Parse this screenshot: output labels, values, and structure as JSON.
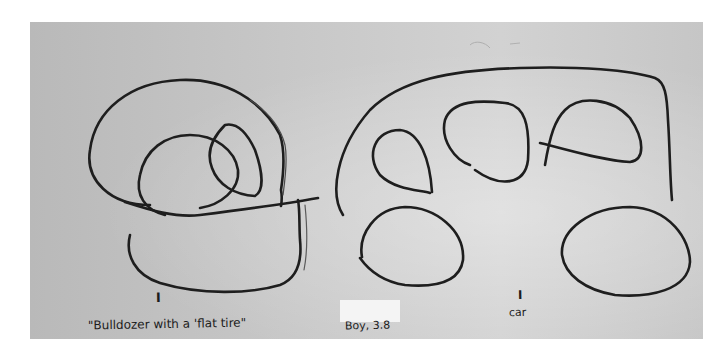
{
  "image": {
    "description": "Scanned child's crayon drawing on gray paper: a bulldozer (left) and a car (right), with handwritten captions.",
    "background_color": "#c6c6c6",
    "stroke_color": "#1e1e1e"
  },
  "drawings": [
    {
      "name": "bulldozer",
      "marker": "I",
      "caption": "\"Bulldozer with a 'flat tire\""
    },
    {
      "name": "car",
      "marker": "I",
      "caption": "car"
    }
  ],
  "subject_label": "Boy, 3.8"
}
